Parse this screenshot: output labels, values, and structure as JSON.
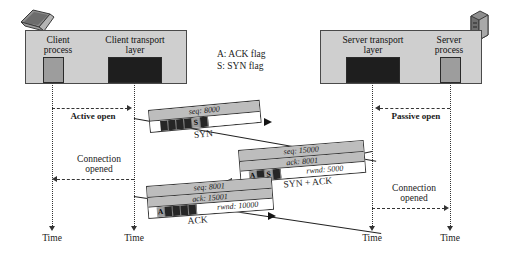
{
  "diagram": {
    "legend": [
      {
        "id": "ack-flag",
        "text": "A: ACK flag"
      },
      {
        "id": "syn-flag",
        "text": "S: SYN flag"
      }
    ],
    "client": {
      "icon": "laptop-icon",
      "process_label": "Client\nprocess",
      "process_line1": "Client",
      "process_line2": "process",
      "transport_line1": "Client transport",
      "transport_line2": "layer"
    },
    "server": {
      "icon": "server-tower-icon",
      "process_line1": "Server",
      "process_line2": "process",
      "transport_line1": "Server transport",
      "transport_line2": "layer"
    },
    "events": {
      "active_open": "Active open",
      "passive_open": "Passive open",
      "client_connection_opened_line1": "Connection",
      "client_connection_opened_line2": "opened",
      "server_connection_opened_line1": "Connection",
      "server_connection_opened_line2": "opened"
    },
    "time_axis_label": "Time",
    "time_labels": [
      "Time",
      "Time",
      "Time",
      "Time"
    ],
    "segments": [
      {
        "id": "syn",
        "name": "SYN",
        "direction": "client-to-server",
        "fields": [
          {
            "key": "seq",
            "text": "seq: 8000"
          }
        ],
        "rwnd": "",
        "flags": [
          {
            "label": "",
            "active": false
          },
          {
            "label": "",
            "active": false
          },
          {
            "label": "",
            "active": false
          },
          {
            "label": "",
            "active": false
          },
          {
            "label": "S",
            "active": true
          },
          {
            "label": "",
            "active": false
          }
        ]
      },
      {
        "id": "syn-ack",
        "name": "SYN + ACK",
        "direction": "server-to-client",
        "fields": [
          {
            "key": "seq",
            "text": "seq: 15000"
          },
          {
            "key": "ack",
            "text": "ack: 8001"
          }
        ],
        "rwnd": "rwnd: 5000",
        "flags": [
          {
            "label": "A",
            "active": true
          },
          {
            "label": "",
            "active": false
          },
          {
            "label": "S",
            "active": true
          },
          {
            "label": "",
            "active": false
          }
        ]
      },
      {
        "id": "ack",
        "name": "ACK",
        "direction": "client-to-server",
        "fields": [
          {
            "key": "seq",
            "text": "seq: 8001"
          },
          {
            "key": "ack",
            "text": "ack: 15001"
          }
        ],
        "rwnd": "rwnd: 10000",
        "flags": [
          {
            "label": "A",
            "active": true
          },
          {
            "label": "",
            "active": false
          },
          {
            "label": "",
            "active": false
          },
          {
            "label": "",
            "active": false
          },
          {
            "label": "",
            "active": false
          }
        ]
      }
    ],
    "colors": {
      "host_box_fill": "#cfcfcf",
      "process_box_fill": "#9d9d9d",
      "transport_box_fill": "#1e1e1e",
      "segment_field_fill": "#bdbdbd",
      "flag_cell_fill": "#262626",
      "flag_active_fill": "#9d9d9d",
      "line": "#333333"
    }
  }
}
